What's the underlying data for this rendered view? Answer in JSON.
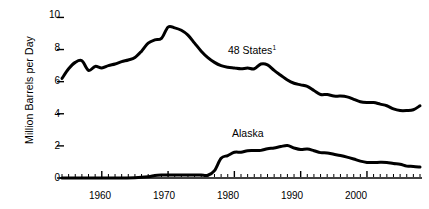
{
  "chart_data": {
    "type": "line",
    "title": "",
    "subtitle": "",
    "xlabel": "",
    "ylabel": "Million Barrels per Day",
    "xlim": [
      1954,
      2008
    ],
    "ylim": [
      0,
      10.4
    ],
    "grid": false,
    "legend_position": "inline-annotation",
    "y_ticks": [
      0,
      2,
      4,
      6,
      8,
      10
    ],
    "y_tick_labels": [
      "0",
      "2",
      "4",
      "6",
      "8",
      "10"
    ],
    "x_ticks": [
      1960,
      1970,
      1980,
      1990,
      2000
    ],
    "x_tick_labels": [
      "1960",
      "1970",
      "1980",
      "1990",
      "2000"
    ],
    "x_minor_tick_interval": 1,
    "series": [
      {
        "name": "48 States",
        "footnote_marker": "1",
        "label_text": "48 States",
        "color": "#000000",
        "x": [
          1954,
          1955,
          1956,
          1957,
          1958,
          1959,
          1960,
          1961,
          1962,
          1963,
          1964,
          1965,
          1966,
          1967,
          1968,
          1969,
          1970,
          1971,
          1972,
          1973,
          1974,
          1975,
          1976,
          1977,
          1978,
          1979,
          1980,
          1981,
          1982,
          1983,
          1984,
          1985,
          1986,
          1987,
          1988,
          1989,
          1990,
          1991,
          1992,
          1993,
          1994,
          1995,
          1996,
          1997,
          1998,
          1999,
          2000,
          2001,
          2002,
          2003,
          2004,
          2005,
          2006,
          2007,
          2008
        ],
        "values": [
          6.2,
          6.8,
          7.2,
          7.3,
          6.7,
          6.95,
          6.85,
          7.0,
          7.1,
          7.25,
          7.35,
          7.5,
          7.9,
          8.4,
          8.6,
          8.7,
          9.4,
          9.35,
          9.2,
          8.9,
          8.4,
          7.9,
          7.5,
          7.2,
          7.0,
          6.9,
          6.85,
          6.8,
          6.85,
          6.8,
          7.1,
          7.05,
          6.7,
          6.4,
          6.1,
          5.9,
          5.8,
          5.7,
          5.45,
          5.2,
          5.2,
          5.1,
          5.1,
          5.05,
          4.9,
          4.75,
          4.7,
          4.7,
          4.6,
          4.5,
          4.3,
          4.2,
          4.2,
          4.25,
          4.5
        ]
      },
      {
        "name": "Alaska",
        "label_text": "Alaska",
        "color": "#000000",
        "x": [
          1954,
          1958,
          1962,
          1965,
          1967,
          1968,
          1969,
          1970,
          1971,
          1972,
          1973,
          1974,
          1975,
          1976,
          1977,
          1978,
          1979,
          1980,
          1981,
          1982,
          1983,
          1984,
          1985,
          1986,
          1987,
          1988,
          1989,
          1990,
          1991,
          1992,
          1993,
          1994,
          1995,
          1996,
          1997,
          1998,
          1999,
          2000,
          2001,
          2002,
          2003,
          2004,
          2005,
          2006,
          2007,
          2008
        ],
        "values": [
          0.0,
          0.0,
          0.0,
          0.02,
          0.08,
          0.15,
          0.18,
          0.19,
          0.19,
          0.19,
          0.19,
          0.19,
          0.18,
          0.17,
          0.46,
          1.23,
          1.4,
          1.6,
          1.61,
          1.7,
          1.71,
          1.72,
          1.82,
          1.87,
          1.96,
          2.02,
          1.87,
          1.77,
          1.8,
          1.7,
          1.58,
          1.56,
          1.48,
          1.4,
          1.3,
          1.18,
          1.05,
          0.97,
          0.96,
          0.98,
          0.97,
          0.9,
          0.86,
          0.74,
          0.72,
          0.68
        ]
      }
    ],
    "annotations": [
      {
        "text": "48 States",
        "superscript": "1",
        "x_value": 1984,
        "y_value": 7.8
      },
      {
        "text": "Alaska",
        "superscript": "",
        "x_value": 1985,
        "y_value": 2.6
      }
    ]
  }
}
